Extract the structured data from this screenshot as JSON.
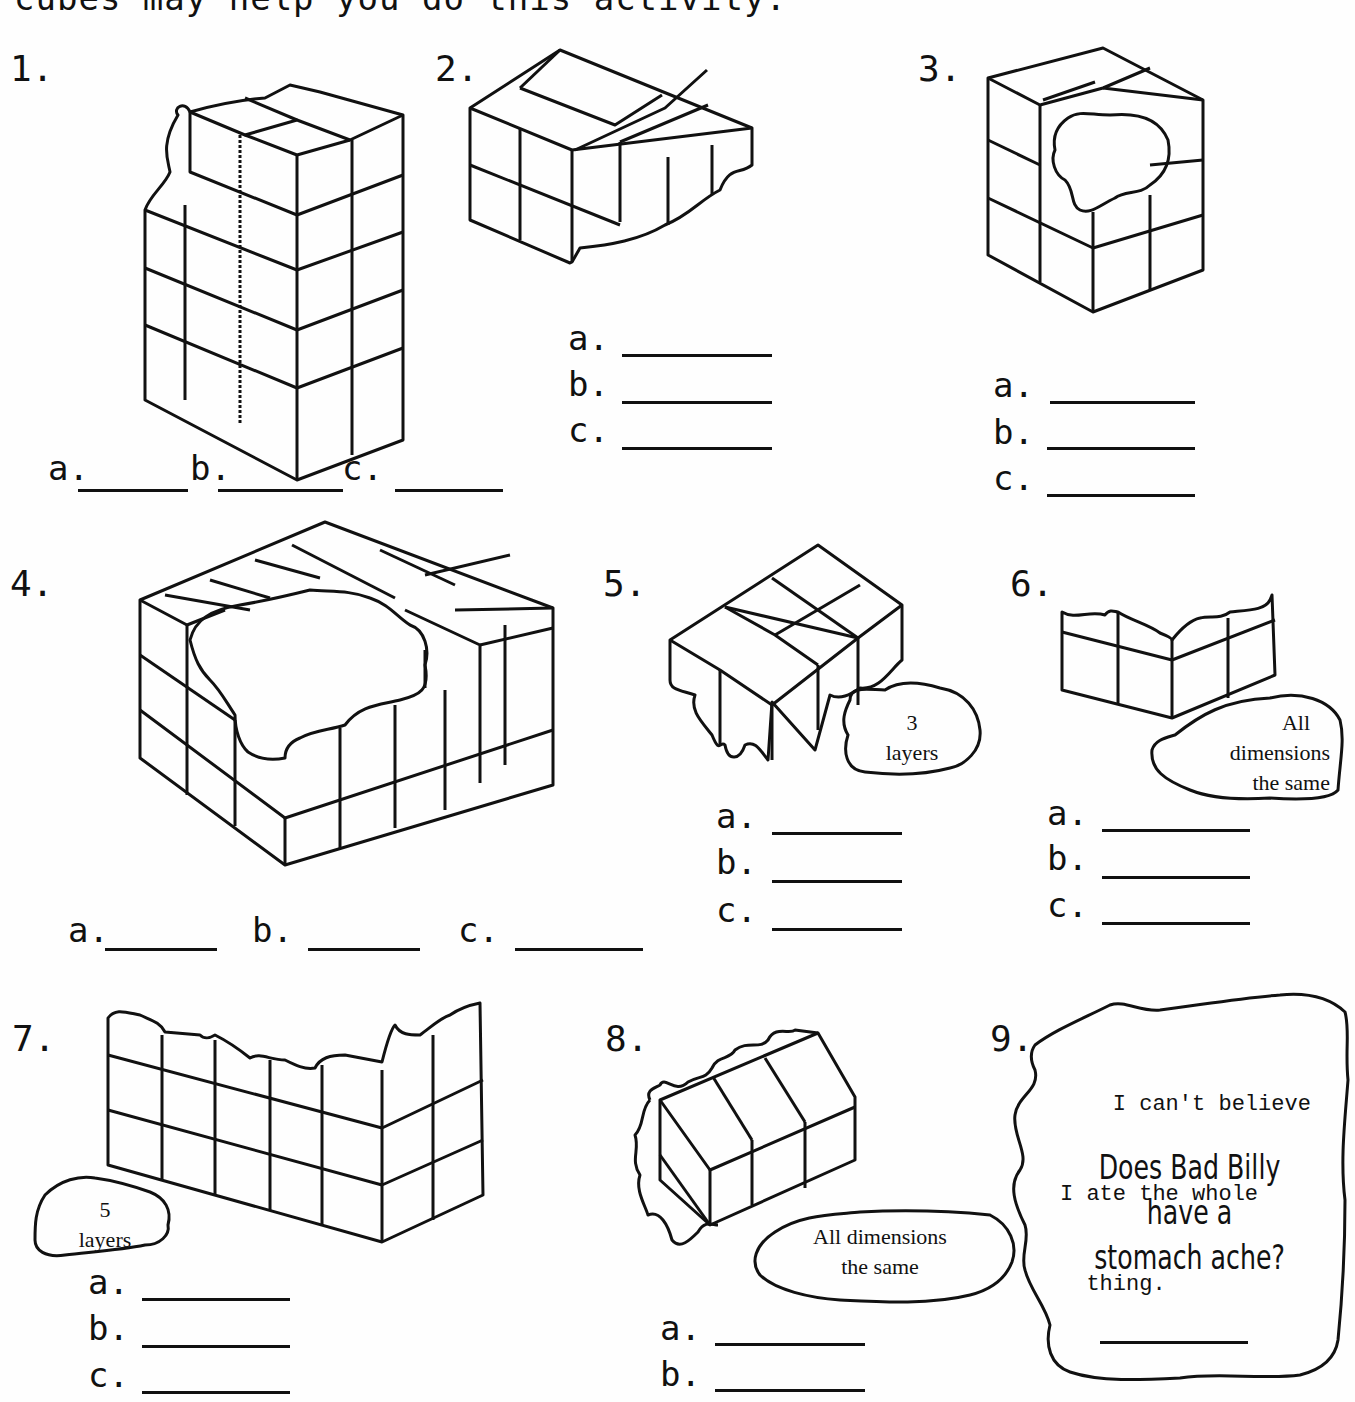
{
  "intro_text": "cubes may help you do this activity.",
  "problems": [
    {
      "number": "1.",
      "answers": [
        {
          "label": "a.",
          "value": ""
        },
        {
          "label": "b.",
          "value": ""
        },
        {
          "label": "c.",
          "value": ""
        }
      ]
    },
    {
      "number": "2.",
      "answers": [
        {
          "label": "a.",
          "value": ""
        },
        {
          "label": "b.",
          "value": ""
        },
        {
          "label": "c.",
          "value": ""
        }
      ]
    },
    {
      "number": "3.",
      "answers": [
        {
          "label": "a.",
          "value": ""
        },
        {
          "label": "b.",
          "value": ""
        },
        {
          "label": "c.",
          "value": ""
        }
      ]
    },
    {
      "number": "4.",
      "answers": [
        {
          "label": "a.",
          "value": ""
        },
        {
          "label": "b.",
          "value": ""
        },
        {
          "label": "c.",
          "value": ""
        }
      ]
    },
    {
      "number": "5.",
      "note": [
        "3",
        "layers"
      ],
      "answers": [
        {
          "label": "a.",
          "value": ""
        },
        {
          "label": "b.",
          "value": ""
        },
        {
          "label": "c.",
          "value": ""
        }
      ]
    },
    {
      "number": "6.",
      "note": [
        "All",
        "dimensions",
        "the same"
      ],
      "answers": [
        {
          "label": "a.",
          "value": ""
        },
        {
          "label": "b.",
          "value": ""
        },
        {
          "label": "c.",
          "value": ""
        }
      ]
    },
    {
      "number": "7.",
      "note": [
        "5",
        "layers"
      ],
      "answers": [
        {
          "label": "a.",
          "value": ""
        },
        {
          "label": "b.",
          "value": ""
        },
        {
          "label": "c.",
          "value": ""
        }
      ]
    },
    {
      "number": "8.",
      "note": [
        "All dimensions",
        "the same"
      ],
      "answers": [
        {
          "label": "a.",
          "value": ""
        },
        {
          "label": "b.",
          "value": ""
        }
      ]
    },
    {
      "number": "9.",
      "quote": [
        "    I can't believe",
        "I ate the whole",
        "  thing."
      ],
      "question": [
        "Does Bad Billy",
        "have a",
        "stomach ache?"
      ],
      "answer": ""
    }
  ]
}
